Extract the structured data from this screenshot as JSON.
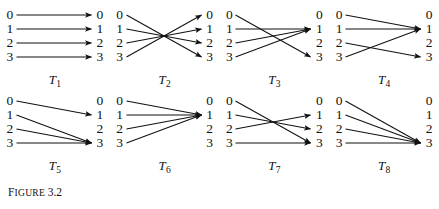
{
  "figure": {
    "caption_prefix_letter": "F",
    "caption_word_rest": "IGURE",
    "caption_number": "3.2",
    "caption_full": "FIGURE 3.2",
    "domain_labels": [
      "0",
      "1",
      "2",
      "3"
    ],
    "codomain_labels": [
      "0",
      "1",
      "2",
      "3"
    ],
    "line_color": "#111111",
    "background_color": "#ffffff"
  },
  "chart_data": {
    "type": "diagram",
    "domain": [
      0,
      1,
      2,
      3
    ],
    "codomain": [
      0,
      1,
      2,
      3
    ],
    "mappings": [
      {
        "name": "T",
        "subscript": "1",
        "label": "T1",
        "targets": [
          0,
          1,
          2,
          3
        ]
      },
      {
        "name": "T",
        "subscript": "2",
        "label": "T2",
        "targets": [
          3,
          2,
          1,
          0
        ]
      },
      {
        "name": "T",
        "subscript": "3",
        "label": "T3",
        "targets": [
          3,
          1,
          1,
          1
        ]
      },
      {
        "name": "T",
        "subscript": "4",
        "label": "T4",
        "targets": [
          1,
          1,
          3,
          1
        ]
      },
      {
        "name": "T",
        "subscript": "5",
        "label": "T5",
        "targets": [
          1,
          3,
          3,
          3
        ]
      },
      {
        "name": "T",
        "subscript": "6",
        "label": "T6",
        "targets": [
          1,
          1,
          1,
          1
        ]
      },
      {
        "name": "T",
        "subscript": "7",
        "label": "T7",
        "targets": [
          3,
          2,
          1,
          3
        ]
      },
      {
        "name": "T",
        "subscript": "8",
        "label": "T8",
        "targets": [
          3,
          3,
          3,
          3
        ]
      }
    ]
  }
}
